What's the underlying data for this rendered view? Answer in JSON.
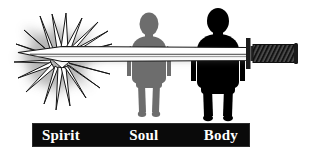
{
  "diagram": {
    "title": "Spirit Soul Body",
    "background_color": "#ffffff",
    "label_bar": {
      "background_color": "#0a0a0a",
      "text_color": "#ffffff",
      "labels": [
        {
          "text": "Spirit",
          "name": "label-spirit"
        },
        {
          "text": "Soul",
          "name": "label-soul"
        },
        {
          "text": "Body",
          "name": "label-body"
        }
      ]
    },
    "figures": [
      {
        "name": "soul-figure",
        "label": "Soul",
        "fill_color": "#6b6b6b",
        "description": "medium gray human silhouette"
      },
      {
        "name": "body-figure",
        "label": "Body",
        "fill_color": "#000000",
        "description": "black human silhouette"
      }
    ],
    "sword": {
      "name": "sword",
      "blade_color": "#ffffff",
      "blade_outline_color": "#1a1a1a",
      "hilt_color": "#3a3a3a",
      "grip_pattern": "diagonal-hatch",
      "description": "long two-edged sword running horizontally through the figures, point at left, hilt at right"
    },
    "burst": {
      "name": "spirit-burst",
      "outline_color": "#1a1a1a",
      "glow_color": "#9a9a9a",
      "description": "spiky starburst with soft gray glow at the sword point, over the Spirit region"
    }
  }
}
